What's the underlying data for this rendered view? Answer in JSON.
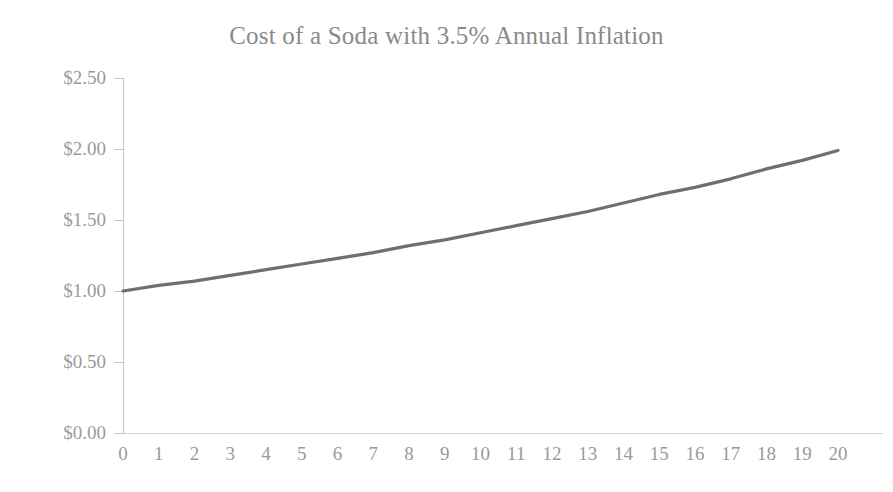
{
  "chart_data": {
    "type": "line",
    "title": "Cost of a Soda with 3.5% Annual Inflation",
    "xlabel": "",
    "ylabel": "",
    "x": [
      0,
      1,
      2,
      3,
      4,
      5,
      6,
      7,
      8,
      9,
      10,
      11,
      12,
      13,
      14,
      15,
      16,
      17,
      18,
      19,
      20
    ],
    "values": [
      1.0,
      1.04,
      1.07,
      1.11,
      1.15,
      1.19,
      1.23,
      1.27,
      1.32,
      1.36,
      1.41,
      1.46,
      1.51,
      1.56,
      1.62,
      1.68,
      1.73,
      1.79,
      1.86,
      1.92,
      1.99
    ],
    "series": [
      {
        "name": "Cost of a Soda",
        "values": [
          1.0,
          1.04,
          1.07,
          1.11,
          1.15,
          1.19,
          1.23,
          1.27,
          1.32,
          1.36,
          1.41,
          1.46,
          1.51,
          1.56,
          1.62,
          1.68,
          1.73,
          1.79,
          1.86,
          1.92,
          1.99
        ]
      }
    ],
    "xlim": [
      0,
      20
    ],
    "ylim": [
      0,
      2.5
    ],
    "xtick_labels": [
      "0",
      "1",
      "2",
      "3",
      "4",
      "5",
      "6",
      "7",
      "8",
      "9",
      "10",
      "11",
      "12",
      "13",
      "14",
      "15",
      "16",
      "17",
      "18",
      "19",
      "20"
    ],
    "ytick_values": [
      0,
      0.5,
      1.0,
      1.5,
      2.0,
      2.5
    ],
    "ytick_labels": [
      "$0.00",
      "$0.50",
      "$1.00",
      "$1.50",
      "$2.00",
      "$2.50"
    ],
    "grid": true,
    "legend": false,
    "legend_position": "none",
    "line_color": "#6f6f6f",
    "axis_color": "#c4c4c4",
    "text_color": "#9a9a9a",
    "background_color": "#ffffff"
  }
}
